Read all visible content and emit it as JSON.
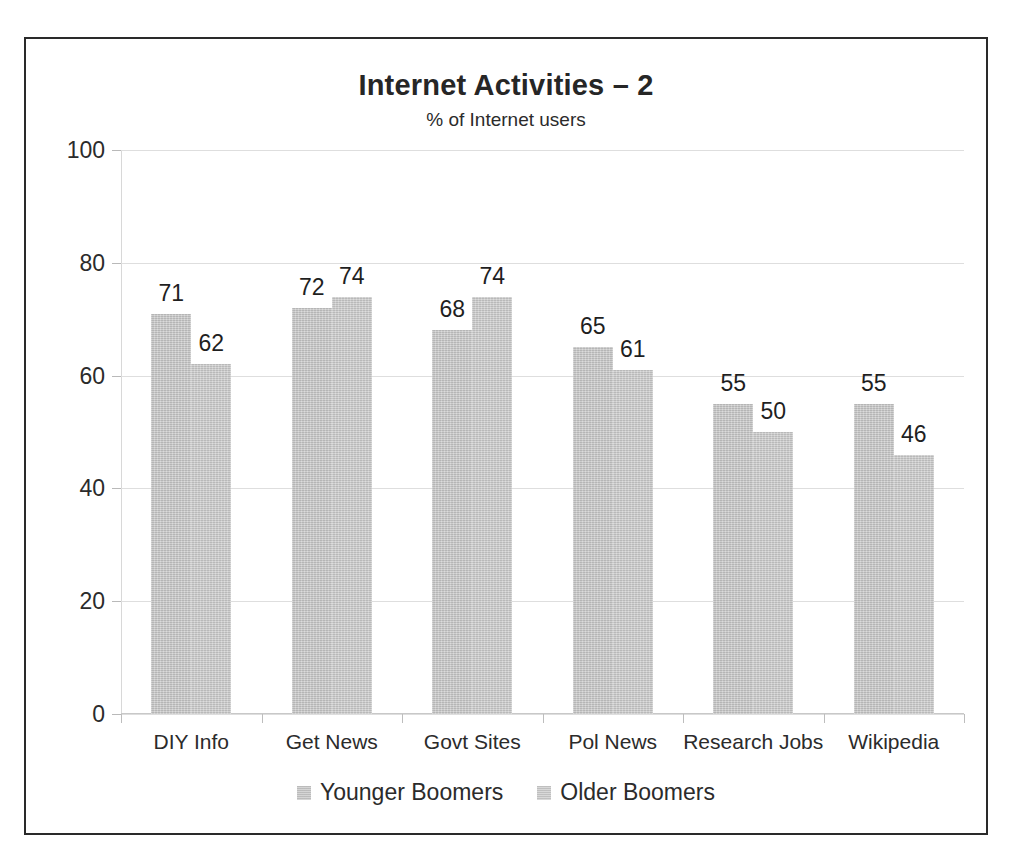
{
  "chart_data": {
    "type": "bar",
    "title": "Internet Activities – 2",
    "subtitle": "% of Internet users",
    "xlabel": "",
    "ylabel": "",
    "ylim": [
      0,
      100
    ],
    "yticks": [
      0,
      20,
      40,
      60,
      80,
      100
    ],
    "ytick_labels": [
      "0",
      "20",
      "40",
      "60",
      "80",
      "100"
    ],
    "grid": true,
    "legend_position": "bottom",
    "categories": [
      "DIY Info",
      "Get News",
      "Govt Sites",
      "Pol News",
      "Research Jobs",
      "Wikipedia"
    ],
    "series": [
      {
        "name": "Younger Boomers",
        "color": "#c7c7c7",
        "values": [
          71,
          72,
          68,
          65,
          55,
          55
        ]
      },
      {
        "name": "Older Boomers",
        "color": "#cbcbcb",
        "values": [
          62,
          74,
          74,
          61,
          50,
          46
        ]
      }
    ],
    "data_labels": [
      [
        "71",
        "62"
      ],
      [
        "72",
        "74"
      ],
      [
        "68",
        "74"
      ],
      [
        "65",
        "61"
      ],
      [
        "55",
        "50"
      ],
      [
        "55",
        "46"
      ]
    ]
  },
  "frame": {
    "border_color": "#2a2a2a"
  }
}
